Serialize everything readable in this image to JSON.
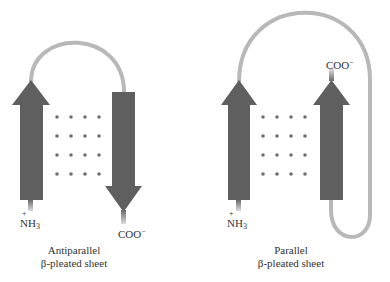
{
  "diagrams": [
    {
      "caption_line1": "Antiparallel",
      "caption_line2": "β-pleated sheet",
      "n_terminus": {
        "base": "NH",
        "sub": "3",
        "charge": "+"
      },
      "c_terminus": {
        "base": "COO",
        "charge": "−"
      }
    },
    {
      "caption_line1": "Parallel",
      "caption_line2": "β-pleated sheet",
      "n_terminus": {
        "base": "NH",
        "sub": "3",
        "charge": "+"
      },
      "c_terminus": {
        "base": "COO",
        "charge": "−"
      }
    }
  ],
  "colors": {
    "strand": "#5f5f5f",
    "loop": "#b8b8b8",
    "dot": "#6e6e6e",
    "text": "#333333"
  }
}
